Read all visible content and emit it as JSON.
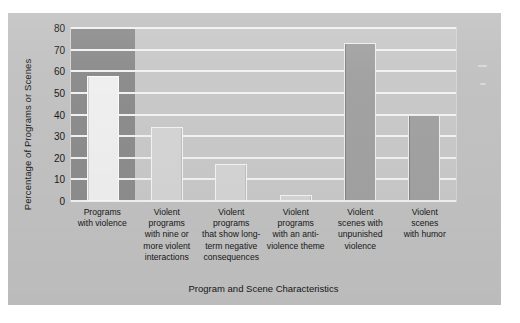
{
  "figure": {
    "background_color": "#c2c2c2",
    "plot_background_color": "#c9c9c9",
    "gridline_color": "#f2f2f2",
    "highlight_column_color": "#8d8d8d"
  },
  "chart_data": {
    "type": "bar",
    "title": "",
    "xlabel": "Program and Scene Characteristics",
    "ylabel": "Percentage of Programs or Scenes",
    "ylim": [
      0,
      80
    ],
    "yticks": [
      0,
      10,
      20,
      30,
      40,
      50,
      60,
      70,
      80
    ],
    "ytick_labels": [
      "0",
      "10",
      "20",
      "30",
      "40",
      "50",
      "60",
      "70",
      "80"
    ],
    "grid": true,
    "legend": "none",
    "categories": [
      "Programs\nwith violence",
      "Violent\nprograms\nwith nine or\nmore violent\ninteractions",
      "Violent\nprograms\nthat show long-\nterm negative\nconsequences",
      "Violent\nprograms\nwith an anti-\nviolence theme",
      "Violent\nscenes with\nunpunished\nviolence",
      "Violent\nscenes\nwith humor"
    ],
    "values": [
      58,
      34,
      17,
      3,
      73,
      40
    ],
    "bar_styles": [
      "light",
      "plain",
      "plain",
      "plain",
      "dark",
      "dark"
    ],
    "highlighted_category_index": 0
  },
  "axis": {
    "y_title": "Percentage of Programs or Scenes",
    "x_title": "Program and Scene Characteristics"
  },
  "categories_display": [
    {
      "lines": [
        "Programs",
        "with violence"
      ]
    },
    {
      "lines": [
        "Violent",
        "programs",
        "with nine or",
        "more violent",
        "interactions"
      ]
    },
    {
      "lines": [
        "Violent",
        "programs",
        "that show long-",
        "term negative",
        "consequences"
      ]
    },
    {
      "lines": [
        "Violent",
        "programs",
        "with an anti-",
        "violence theme"
      ]
    },
    {
      "lines": [
        "Violent",
        "scenes with",
        "unpunished",
        "violence"
      ]
    },
    {
      "lines": [
        "Violent",
        "scenes",
        "with humor"
      ]
    }
  ]
}
